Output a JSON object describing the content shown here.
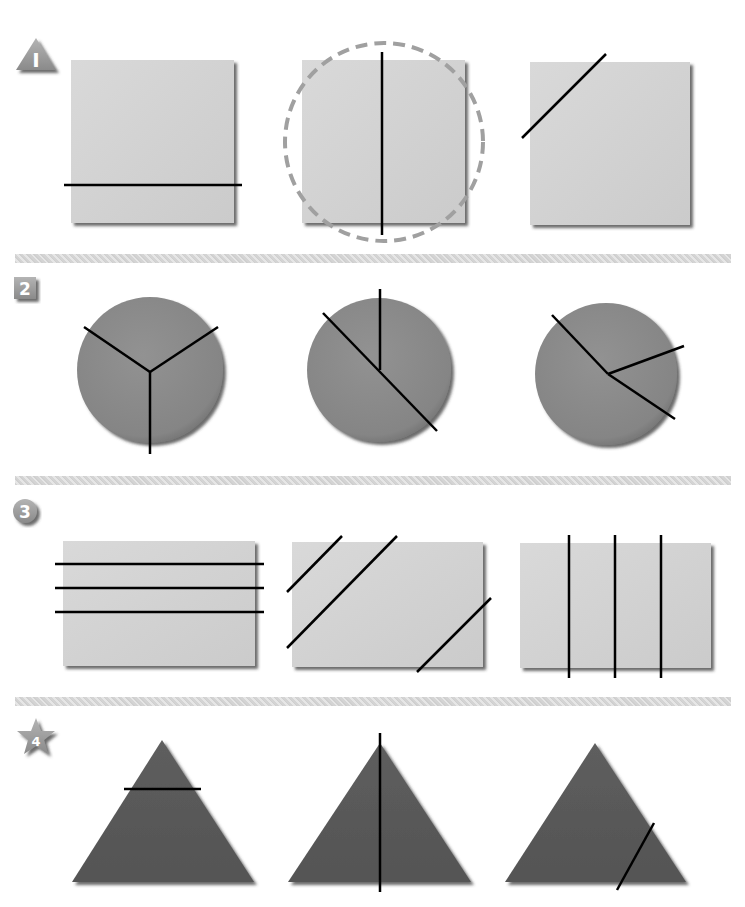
{
  "colors": {
    "background": "#ffffff",
    "square_fill": "#d2d2d2",
    "square_shadow": "#7a7a7a",
    "circle_fill": "#8a8a8a",
    "triangle_fill": "#5a5a5a",
    "cut_line": "#000000",
    "dashed_circle": "#a0a0a0",
    "badge_fill": "#9a9a9a",
    "divider": "#d8d8d8"
  },
  "sections": [
    {
      "id": 1,
      "badge": {
        "shape": "warning-triangle",
        "label": "I"
      },
      "items": [
        {
          "shape": "square",
          "lines": "horizontal line near bottom",
          "highlighted": false
        },
        {
          "shape": "square",
          "lines": "vertical line through center",
          "highlighted": true
        },
        {
          "shape": "square",
          "lines": "diagonal line across top-left corner",
          "highlighted": false
        }
      ]
    },
    {
      "id": 2,
      "badge": {
        "shape": "square",
        "label": "2"
      },
      "items": [
        {
          "shape": "circle",
          "lines": "three radii (Y shape), equal thirds"
        },
        {
          "shape": "circle",
          "lines": "diameter plus one vertical radius"
        },
        {
          "shape": "circle",
          "lines": "three unequal radii"
        }
      ]
    },
    {
      "id": 3,
      "badge": {
        "shape": "circle",
        "label": "3"
      },
      "items": [
        {
          "shape": "rectangle",
          "lines": "three horizontal lines"
        },
        {
          "shape": "rectangle",
          "lines": "three parallel diagonal lines"
        },
        {
          "shape": "rectangle",
          "lines": "three vertical lines, equal quarters"
        }
      ]
    },
    {
      "id": 4,
      "badge": {
        "shape": "star",
        "label": "4"
      },
      "items": [
        {
          "shape": "triangle",
          "lines": "horizontal line near apex"
        },
        {
          "shape": "triangle",
          "lines": "vertical line through apex"
        },
        {
          "shape": "triangle",
          "lines": "slanted line across bottom-right"
        }
      ]
    }
  ]
}
